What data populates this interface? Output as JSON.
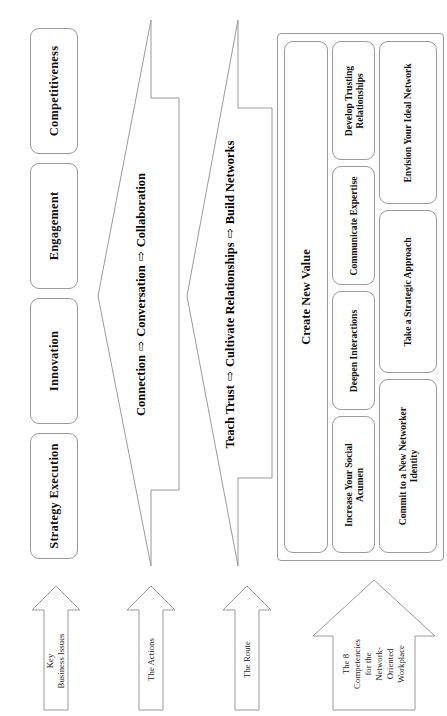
{
  "diagram": {
    "orientation": "rotated-90-ccw",
    "stroke_color": "#9a9a9a",
    "text_color": "#111111",
    "background": "#ffffff"
  },
  "row_labels": [
    {
      "key": "key_business_issues",
      "text": "Key\nBusiness Issues"
    },
    {
      "key": "the_actions",
      "text": "The Actions"
    },
    {
      "key": "the_route",
      "text": "The Route"
    },
    {
      "key": "the_competencies",
      "text": "The 8\nCompetencies\nfor the\nNetwork-\nOriented\nWorkplace"
    }
  ],
  "key_business_issues": {
    "label": "Key Business Issues",
    "items": [
      {
        "label": "Strategy Execution"
      },
      {
        "label": "Innovation"
      },
      {
        "label": "Engagement"
      },
      {
        "label": "Competitiveness"
      }
    ]
  },
  "actions": {
    "label": "The Actions",
    "parts": [
      "Connection",
      "Conversation",
      "Collaboration"
    ],
    "separator": "⇨",
    "full_text": "Connection ⇨ Conversation ⇨ Collaboration"
  },
  "route": {
    "label": "The Route",
    "parts": [
      "Teach Trust",
      "Cultivate Relationships",
      "Build Networks"
    ],
    "separator": "⇨",
    "full_text": "Teach Trust ⇨ Cultivate Relationships ⇨ Build Networks"
  },
  "competencies": {
    "label": "The 8 Competencies for the Network-Oriented Workplace",
    "create_new_value": "Create New Value",
    "row_top": [
      {
        "label": "Increase Your Social Acumen"
      },
      {
        "label": "Deepen Interactions"
      },
      {
        "label": "Communicate Expertise"
      },
      {
        "label": "Develop Trusting Relationships"
      }
    ],
    "row_bottom": [
      {
        "label": "Commit to a New Networker Identity"
      },
      {
        "label": "Take a Strategic Approach"
      },
      {
        "label": "Envision Your Ideal Network"
      }
    ]
  }
}
